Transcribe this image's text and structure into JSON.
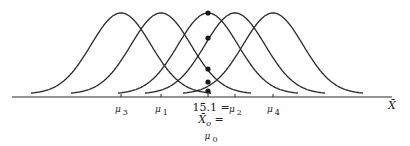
{
  "diagram": {
    "type": "sampling-distributions",
    "axis": {
      "label": "X̄",
      "y": 97,
      "x_start": 12,
      "x_end": 392
    },
    "curves": [
      {
        "id": "mu3",
        "label_symbol": "μ",
        "label_sub": "3",
        "center_x": 121
      },
      {
        "id": "mu1",
        "label_symbol": "μ",
        "label_sub": "1",
        "center_x": 161
      },
      {
        "id": "mu0",
        "label_symbol": "μ",
        "label_sub": "0",
        "center_x": 208
      },
      {
        "id": "mu2",
        "label_symbol": "μ",
        "label_sub": "2",
        "center_x": 235
      },
      {
        "id": "mu4",
        "label_symbol": "μ",
        "label_sub": "4",
        "center_x": 273
      }
    ],
    "observed": {
      "line1": "15.1 =",
      "line2": "X̄",
      "line2_sub": "o",
      "line2_suffix": " =",
      "line3_symbol": "μ",
      "line3_sub": "0",
      "x": 208
    },
    "dot_ys": [
      13,
      38,
      69,
      82,
      91
    ],
    "peak_y": 13,
    "half_width": 90,
    "colors": {
      "stroke": "#2a2a2a",
      "dot": "#1a1a1a"
    }
  }
}
